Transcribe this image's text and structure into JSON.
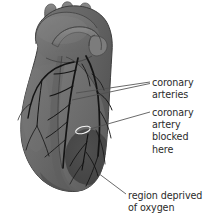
{
  "figure": {
    "kind": "anatomical-diagram",
    "background_color": "#ffffff",
    "width": 205,
    "height": 222
  },
  "colors": {
    "heart_body": "#6e6e6e",
    "heart_body_light": "#7d7d7d",
    "heart_body_dark": "#5a5a5a",
    "deprived_region": "#4a4a4a",
    "artery_line": "#1a1a1a",
    "outline": "#3a3a3a",
    "leader_line": "#555555",
    "label_text": "#2b2b2b",
    "blockage_marker": "#f2f2f2"
  },
  "labels": [
    {
      "id": "coronary-arteries",
      "text": "coronary\narteries",
      "lines": [
        "coronary",
        "arteries"
      ],
      "x": 152,
      "y": 77
    },
    {
      "id": "coronary-artery-blocked-here",
      "text": "coronary\nartery\nblocked\nhere",
      "lines": [
        "coronary",
        "artery",
        "blocked",
        "here"
      ],
      "x": 152,
      "y": 107
    },
    {
      "id": "region-deprived-of-oxygen",
      "text": "region deprived\nof oxygen",
      "lines": [
        "region deprived",
        "of oxygen"
      ],
      "x": 128,
      "y": 190
    }
  ],
  "leader_lines": [
    {
      "id": "leader-coronary-arteries-upper",
      "from": [
        150,
        82
      ],
      "to": [
        76,
        94
      ]
    },
    {
      "id": "leader-coronary-arteries-lower",
      "from": [
        150,
        83
      ],
      "to": [
        72,
        100
      ]
    },
    {
      "id": "leader-artery-blocked",
      "from": [
        150,
        112
      ],
      "to": [
        88,
        130
      ]
    },
    {
      "id": "leader-region-deprived",
      "from": [
        126,
        194
      ],
      "to": [
        98,
        174
      ]
    }
  ],
  "annotations": {
    "blockage_marker": {
      "name": "blockage-ellipse",
      "cx": 83,
      "cy": 130,
      "rx": 7.5,
      "ry": 3.2,
      "rotation": -16
    },
    "deprived_region": {
      "name": "oxygen-deprived-area",
      "cx": 88,
      "cy": 157,
      "rx": 23,
      "ry": 28
    }
  }
}
